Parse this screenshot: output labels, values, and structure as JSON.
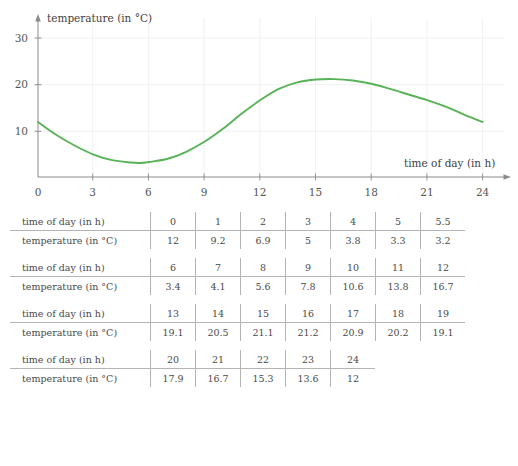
{
  "chart_data": {
    "type": "line",
    "title": "",
    "xlabel": "time of day (in h)",
    "ylabel": "temperature (in °C)",
    "xlim": [
      0,
      24
    ],
    "ylim": [
      0,
      32
    ],
    "xticks": [
      0,
      3,
      6,
      9,
      12,
      15,
      18,
      21,
      24
    ],
    "yticks": [
      10,
      20,
      30
    ],
    "grid": true,
    "legend": null,
    "series_color": "#58b358",
    "x": [
      0,
      1,
      2,
      3,
      4,
      5,
      5.5,
      6,
      7,
      8,
      9,
      10,
      11,
      12,
      13,
      14,
      15,
      16,
      17,
      18,
      19,
      20,
      21,
      22,
      23,
      24
    ],
    "y": [
      12,
      9.2,
      6.9,
      5,
      3.8,
      3.3,
      3.2,
      3.4,
      4.1,
      5.6,
      7.8,
      10.6,
      13.8,
      16.7,
      19.1,
      20.5,
      21.1,
      21.2,
      20.9,
      20.2,
      19.1,
      17.9,
      16.7,
      15.3,
      13.6,
      12
    ]
  },
  "axes": {
    "y_axis_title": "temperature (in °C)",
    "x_axis_title": "time of day (in h)",
    "y_tick_labels": [
      "30",
      "20",
      "10"
    ],
    "x_tick_labels": [
      "0",
      "3",
      "6",
      "9",
      "12",
      "15",
      "18",
      "21",
      "24"
    ]
  },
  "tables": {
    "row_label_time": "time of day (in h)",
    "row_label_temp": "temperature (in °C)",
    "blocks": [
      {
        "time": [
          "0",
          "1",
          "2",
          "3",
          "4",
          "5",
          "5.5"
        ],
        "temp": [
          "12",
          "9.2",
          "6.9",
          "5",
          "3.8",
          "3.3",
          "3.2"
        ]
      },
      {
        "time": [
          "6",
          "7",
          "8",
          "9",
          "10",
          "11",
          "12"
        ],
        "temp": [
          "3.4",
          "4.1",
          "5.6",
          "7.8",
          "10.6",
          "13.8",
          "16.7"
        ]
      },
      {
        "time": [
          "13",
          "14",
          "15",
          "16",
          "17",
          "18",
          "19"
        ],
        "temp": [
          "19.1",
          "20.5",
          "21.1",
          "21.2",
          "20.9",
          "20.2",
          "19.1"
        ]
      },
      {
        "time": [
          "20",
          "21",
          "22",
          "23",
          "24"
        ],
        "temp": [
          "17.9",
          "16.7",
          "15.3",
          "13.6",
          "12"
        ]
      }
    ]
  }
}
